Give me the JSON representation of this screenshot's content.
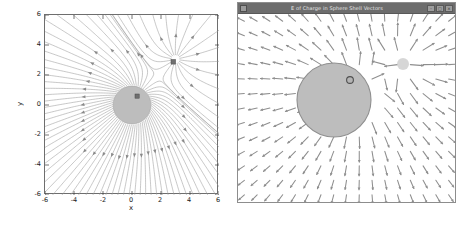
{
  "figure": {
    "panels": [
      "streamplot-panel",
      "vector-window-panel"
    ],
    "colors": {
      "streamline": "#9a9a9a",
      "sphere_fill": "#bdbdbd",
      "sphere_edge": "#9a9a9a",
      "point_charge": "#6f6f6f",
      "vector_arrow": "#8e8e8e",
      "axis": "#6e6e6e",
      "titlebar": "#6d6d6d",
      "background": "#ffffff"
    }
  },
  "left_panel": {
    "name": "electric-field-streamplot",
    "xlabel": "x",
    "ylabel": "y",
    "xticks": [
      "-6",
      "-4",
      "-2",
      "0",
      "2",
      "4",
      "6"
    ],
    "yticks": [
      "-6",
      "-4",
      "-2",
      "0",
      "2",
      "4",
      "6"
    ]
  },
  "right_panel": {
    "window_title": "E of Charge in Sphere Shell Vectors",
    "buttons": {
      "minimize": "–",
      "maximize": "□",
      "close": "×"
    },
    "icon": "app-icon"
  },
  "chart_data": [
    {
      "type": "line",
      "name": "streamplot",
      "title": "",
      "xlabel": "x",
      "ylabel": "y",
      "xlim": [
        -6,
        6
      ],
      "ylim": [
        -6,
        6
      ],
      "xticks": [
        -6,
        -4,
        -2,
        0,
        2,
        4,
        6
      ],
      "yticks": [
        -6,
        -4,
        -2,
        0,
        2,
        4,
        6
      ],
      "grid": false,
      "legend": false,
      "annotations": [
        {
          "label": "conducting sphere",
          "x": 0.0,
          "y": 0.0,
          "radius": 1.3,
          "shape": "disk"
        },
        {
          "label": "inner point charge",
          "x": 0.35,
          "y": 0.62,
          "radius": 0.12,
          "shape": "marker"
        },
        {
          "label": "external point charge",
          "x": 3.0,
          "y": 3.05,
          "radius": 0.14,
          "shape": "marker"
        }
      ],
      "series": [
        {
          "name": "field-streamlines",
          "description": "radial streamlines emanating from sphere and external charge",
          "count": 64
        }
      ]
    },
    {
      "type": "scatter",
      "name": "vector-field",
      "title": "E of Charge in Sphere Shell Vectors",
      "xlabel": "",
      "ylabel": "",
      "xlim": [
        -6,
        6
      ],
      "ylim": [
        -5,
        5
      ],
      "grid": false,
      "legend": false,
      "annotations": [
        {
          "label": "conducting sphere",
          "x": -0.3,
          "y": 0.45,
          "radius": 1.6,
          "shape": "disk"
        },
        {
          "label": "inner point charge",
          "x": 0.35,
          "y": 1.05,
          "radius": 0.14,
          "shape": "marker"
        },
        {
          "label": "external charge glow",
          "x": 3.1,
          "y": 2.35,
          "radius": 0.3,
          "shape": "blob"
        }
      ],
      "series": [
        {
          "name": "field-vectors",
          "description": "short radial arrow glyphs sampled on a grid",
          "count": 170
        }
      ]
    }
  ]
}
